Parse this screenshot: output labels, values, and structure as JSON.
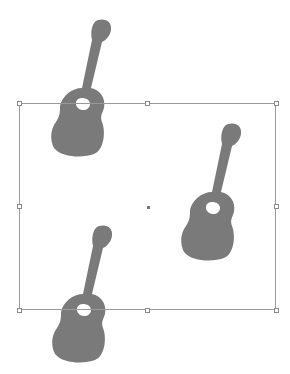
{
  "canvas": {
    "background": "#ffffff",
    "shape_color": "#7a7a7a",
    "selection": {
      "x": 19,
      "y": 103,
      "width": 257,
      "height": 207,
      "border_color": "#9a9a9a"
    },
    "shapes": [
      {
        "name": "guitar-top-left",
        "x": 50,
        "y": 18
      },
      {
        "name": "guitar-right",
        "x": 180,
        "y": 122
      },
      {
        "name": "guitar-bottom",
        "x": 51,
        "y": 224
      }
    ]
  }
}
